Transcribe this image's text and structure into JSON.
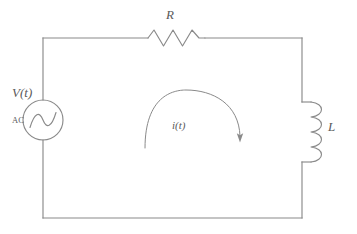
{
  "diagram": {
    "type": "electrical-circuit-schematic",
    "background_color": "#ffffff",
    "line_color": "#8a8a8a",
    "text_color": "#5a5a5a"
  },
  "labels": {
    "resistor": "R",
    "inductor": "L",
    "source_voltage": "V(t)",
    "source_type": "AC",
    "current": "i(t)"
  },
  "components": [
    {
      "id": "voltage-source",
      "kind": "ac-voltage-source",
      "label": "V(t)",
      "sublabel": "AC",
      "symbol": "circle-with-sine",
      "position": "left-rail"
    },
    {
      "id": "resistor",
      "kind": "resistor",
      "label": "R",
      "symbol": "zigzag",
      "position": "top-rail"
    },
    {
      "id": "inductor",
      "kind": "inductor",
      "label": "L",
      "symbol": "coil",
      "position": "right-rail"
    },
    {
      "id": "current-arrow",
      "kind": "current-direction-arrow",
      "label": "i(t)",
      "symbol": "clockwise-arc-arrow",
      "position": "center"
    }
  ]
}
